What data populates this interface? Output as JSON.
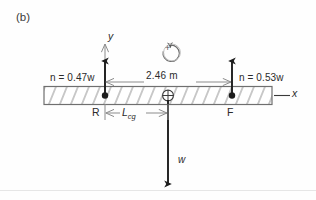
{
  "figure": {
    "panel_label": "(b)",
    "type": "free-body-diagram",
    "axes": {
      "y_label": "y",
      "x_label": "x"
    },
    "moment_convention": {
      "symbol": "(+)",
      "sign": "+",
      "direction": "counterclockwise"
    },
    "forces": {
      "left_normal": {
        "label": "n = 0.47w",
        "direction": "up",
        "point_label": "R"
      },
      "right_normal": {
        "label": "n = 0.53w",
        "direction": "up",
        "point_label": "F"
      },
      "weight": {
        "label": "w",
        "direction": "down"
      }
    },
    "dimensions": {
      "span": "2.46 m",
      "cg_distance": "L",
      "cg_subscript": "cg"
    },
    "colors": {
      "ink": "#2b2b2b",
      "hatch": "#9a9a9a",
      "dimension": "#8c8c8c",
      "background": "#fefefe"
    }
  }
}
